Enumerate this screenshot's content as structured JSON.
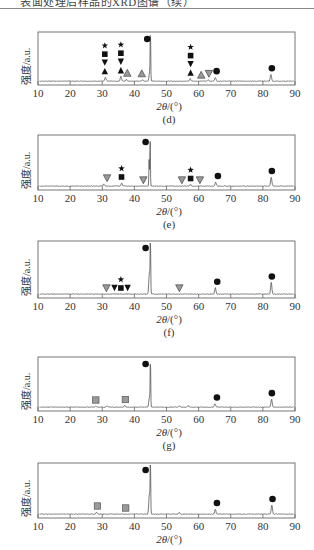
{
  "header": {
    "text": "表面处理后样品的XRD图谱（续）"
  },
  "axis": {
    "xlabel_prefix": "2θ",
    "xlabel_suffix": "/(°)",
    "ylabel": "强度/a.u.",
    "xticks": [
      "10",
      "20",
      "30",
      "40",
      "50",
      "60",
      "70",
      "80",
      "90"
    ],
    "xlim": [
      10,
      90
    ]
  },
  "colors": {
    "line": "#555555",
    "frame": "#666666",
    "marker_black": "#111111",
    "marker_gray": "#9a9a9a"
  },
  "chart_data": [
    {
      "type": "line",
      "panel": "(d)",
      "title": "",
      "xlabel": "2θ/(°)",
      "ylabel": "强度/a.u.",
      "xlim": [
        10,
        90
      ],
      "grid": false,
      "peaks": [
        {
          "x": 31.0,
          "h": 0.08
        },
        {
          "x": 35.8,
          "h": 0.1
        },
        {
          "x": 37.5,
          "h": 0.04
        },
        {
          "x": 42.5,
          "h": 0.03
        },
        {
          "x": 44.8,
          "h": 0.22
        },
        {
          "x": 45.0,
          "h": 1.0
        },
        {
          "x": 57.4,
          "h": 0.05
        },
        {
          "x": 63.0,
          "h": 0.03
        },
        {
          "x": 65.2,
          "h": 0.08
        },
        {
          "x": 82.5,
          "h": 0.14
        }
      ],
      "markers": [
        {
          "x": 30.8,
          "stack": [
            "star",
            "square",
            "tri-down",
            "tri-up"
          ]
        },
        {
          "x": 35.8,
          "stack": [
            "star",
            "square",
            "tri-down",
            "tri-up"
          ]
        },
        {
          "x": 37.8,
          "stack": [
            "gray-tri-up"
          ]
        },
        {
          "x": 42.3,
          "stack": [
            "gray-tri-up"
          ]
        },
        {
          "x": 44.0,
          "stack": [
            "circle"
          ],
          "level": "top"
        },
        {
          "x": 57.5,
          "stack": [
            "star",
            "square",
            "tri-down",
            "tri-up"
          ]
        },
        {
          "x": 60.8,
          "stack": [
            "gray-tri-up"
          ]
        },
        {
          "x": 63.2,
          "stack": [
            "gray-tri-down"
          ]
        },
        {
          "x": 65.6,
          "stack": [
            "circle"
          ]
        },
        {
          "x": 82.8,
          "stack": [
            "circle"
          ]
        }
      ]
    },
    {
      "type": "line",
      "panel": "(e)",
      "xlabel": "2θ/(°)",
      "ylabel": "强度/a.u.",
      "xlim": [
        10,
        90
      ],
      "grid": false,
      "peaks": [
        {
          "x": 30.5,
          "h": 0.04
        },
        {
          "x": 36.0,
          "h": 0.06
        },
        {
          "x": 44.6,
          "h": 0.55
        },
        {
          "x": 44.9,
          "h": 1.0
        },
        {
          "x": 57.5,
          "h": 0.03
        },
        {
          "x": 65.3,
          "h": 0.08
        },
        {
          "x": 82.6,
          "h": 0.18
        }
      ],
      "markers": [
        {
          "x": 31.5,
          "stack": [
            "gray-tri-down"
          ]
        },
        {
          "x": 36.0,
          "stack": [
            "star",
            "square"
          ]
        },
        {
          "x": 42.8,
          "stack": [
            "gray-tri-down"
          ]
        },
        {
          "x": 43.5,
          "stack": [
            "circle"
          ],
          "level": "top"
        },
        {
          "x": 54.8,
          "stack": [
            "gray-tri-down"
          ]
        },
        {
          "x": 57.5,
          "stack": [
            "star",
            "square"
          ]
        },
        {
          "x": 60.4,
          "stack": [
            "gray-tri-down"
          ]
        },
        {
          "x": 66.0,
          "stack": [
            "circle"
          ]
        },
        {
          "x": 82.8,
          "stack": [
            "circle"
          ]
        }
      ]
    },
    {
      "type": "line",
      "panel": "(f)",
      "xlabel": "2θ/(°)",
      "ylabel": "强度/a.u.",
      "xlim": [
        10,
        90
      ],
      "grid": false,
      "peaks": [
        {
          "x": 44.7,
          "h": 0.42
        },
        {
          "x": 45.0,
          "h": 1.0
        },
        {
          "x": 65.2,
          "h": 0.12
        },
        {
          "x": 82.6,
          "h": 0.22
        }
      ],
      "markers": [
        {
          "x": 31.3,
          "stack": [
            "gray-tri-down"
          ]
        },
        {
          "x": 33.8,
          "stack": [
            "tri-down"
          ]
        },
        {
          "x": 35.8,
          "stack": [
            "star",
            "square"
          ]
        },
        {
          "x": 37.9,
          "stack": [
            "tri-down"
          ]
        },
        {
          "x": 43.5,
          "stack": [
            "circle"
          ],
          "level": "top"
        },
        {
          "x": 54.0,
          "stack": [
            "gray-tri-down"
          ]
        },
        {
          "x": 65.8,
          "stack": [
            "circle"
          ]
        },
        {
          "x": 82.8,
          "stack": [
            "circle"
          ]
        }
      ]
    },
    {
      "type": "line",
      "panel": "(g)",
      "xlabel": "2θ/(°)",
      "ylabel": "强度/a.u.",
      "xlim": [
        10,
        90
      ],
      "grid": false,
      "peaks": [
        {
          "x": 28.0,
          "h": 0.02
        },
        {
          "x": 31.5,
          "h": 0.03
        },
        {
          "x": 37.0,
          "h": 0.03
        },
        {
          "x": 44.7,
          "h": 0.2
        },
        {
          "x": 45.0,
          "h": 1.0
        },
        {
          "x": 54.0,
          "h": 0.03
        },
        {
          "x": 56.7,
          "h": 0.03
        },
        {
          "x": 65.1,
          "h": 0.07
        },
        {
          "x": 82.7,
          "h": 0.16
        }
      ],
      "markers": [
        {
          "x": 28.0,
          "stack": [
            "gray-square"
          ]
        },
        {
          "x": 37.2,
          "stack": [
            "gray-square"
          ]
        },
        {
          "x": 43.5,
          "stack": [
            "circle"
          ],
          "level": "top"
        },
        {
          "x": 65.7,
          "stack": [
            "circle"
          ]
        },
        {
          "x": 82.8,
          "stack": [
            "circle"
          ]
        }
      ]
    },
    {
      "type": "line",
      "panel": "(h)",
      "xlabel": "2θ/(°)",
      "ylabel": "强度/a.u.",
      "xlim": [
        10,
        90
      ],
      "grid": false,
      "peaks": [
        {
          "x": 28.2,
          "h": 0.04
        },
        {
          "x": 44.7,
          "h": 0.42
        },
        {
          "x": 45.0,
          "h": 1.0
        },
        {
          "x": 54.0,
          "h": 0.03
        },
        {
          "x": 65.2,
          "h": 0.1
        },
        {
          "x": 82.8,
          "h": 0.18
        }
      ],
      "markers": [
        {
          "x": 28.5,
          "stack": [
            "gray-square"
          ]
        },
        {
          "x": 37.3,
          "stack": [
            "gray-square"
          ]
        },
        {
          "x": 43.5,
          "stack": [
            "circle"
          ],
          "level": "top"
        },
        {
          "x": 65.7,
          "stack": [
            "circle"
          ]
        },
        {
          "x": 83.0,
          "stack": [
            "circle"
          ]
        }
      ]
    }
  ],
  "panels": [
    {
      "label": "(d)",
      "top": 32,
      "bottom": 85,
      "show_label": true
    },
    {
      "label": "(e)",
      "top": 135,
      "bottom": 190,
      "show_label": true
    },
    {
      "label": "(f)",
      "top": 241,
      "bottom": 298,
      "show_label": true
    },
    {
      "label": "(g)",
      "top": 357,
      "bottom": 411,
      "show_label": true
    },
    {
      "label": "",
      "top": 463,
      "bottom": 518,
      "show_label": false
    }
  ]
}
